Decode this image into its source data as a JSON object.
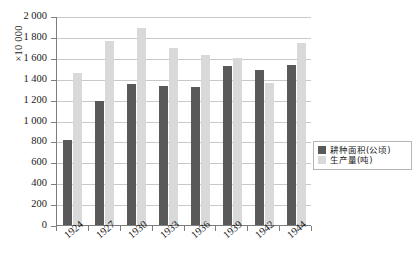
{
  "chart_data": {
    "type": "bar",
    "title": "",
    "subtitle": "",
    "xlabel": "",
    "ylabel": "",
    "y_unit_label": "×10 000",
    "categories": [
      "1924",
      "1927",
      "1930",
      "1933",
      "1936",
      "1939",
      "1942",
      "1944"
    ],
    "series": [
      {
        "name": "耕种面积(公顷)",
        "color": "#595959",
        "values": [
          810,
          1190,
          1350,
          1330,
          1320,
          1520,
          1480,
          1530
        ]
      },
      {
        "name": "生产量(吨)",
        "color": "#d9d9d9",
        "values": [
          1455,
          1765,
          1890,
          1690,
          1630,
          1600,
          1355,
          1740
        ]
      }
    ],
    "ylim": [
      0,
      2000
    ],
    "yticks": [
      0,
      200,
      400,
      600,
      800,
      1000,
      1200,
      1400,
      1600,
      1800,
      2000
    ],
    "ytick_labels": [
      "0",
      "200",
      "400",
      "600",
      "800",
      "1 000",
      "1 200",
      "1 400",
      "1 600",
      "1 800",
      "2 000"
    ],
    "grid": true,
    "legend_position": "inside-right"
  },
  "legend": {
    "entries": [
      {
        "label": "耕种面积(公顷)",
        "color": "#595959"
      },
      {
        "label": "生产量(吨)",
        "color": "#d9d9d9"
      }
    ]
  },
  "caption": {
    "text": ""
  },
  "colors": {
    "series_dark": "#595959",
    "series_light": "#d9d9d9",
    "grid": "#c9c9c9",
    "axis": "#7d7d7d",
    "background": "#ffffff"
  }
}
